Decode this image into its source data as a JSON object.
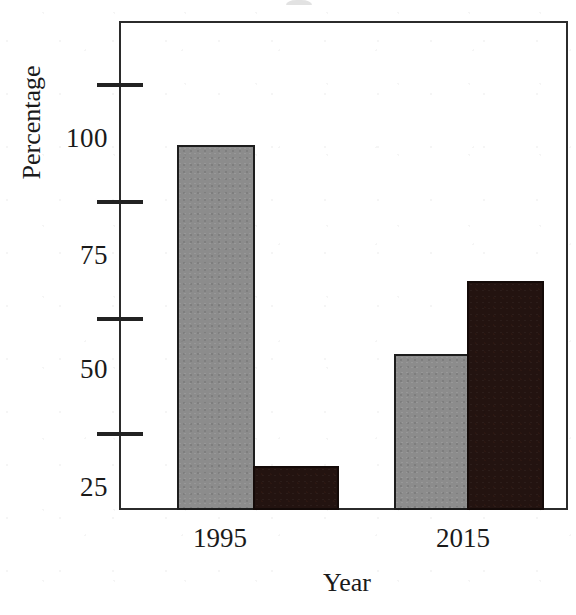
{
  "chart_data": {
    "type": "bar",
    "title": "",
    "xlabel": "Year",
    "ylabel": "Percentage",
    "categories": [
      "1995",
      "2015"
    ],
    "series": [
      {
        "name": "series-gray",
        "color": "#8c8c8c",
        "values": [
          95,
          52
        ]
      },
      {
        "name": "series-dark",
        "color": "#231310",
        "values": [
          29,
          67
        ]
      }
    ],
    "ylim": [
      20,
      120
    ],
    "ytick_labels": [
      "100",
      "75",
      "50",
      "25"
    ],
    "ytick_values": [
      100,
      75,
      50,
      25
    ],
    "grid": false,
    "legend": "none",
    "frame": "box"
  },
  "axes": {
    "y_title": "Percentage",
    "x_title": "Year",
    "y_ticks": [
      {
        "label": "100",
        "value": 100
      },
      {
        "label": "75",
        "value": 75
      },
      {
        "label": "50",
        "value": 50
      },
      {
        "label": "25",
        "value": 25
      }
    ],
    "x_groups": [
      {
        "label": "1995"
      },
      {
        "label": "2015"
      }
    ]
  },
  "bars": [
    {
      "group": "1995",
      "series": "series-gray",
      "value": 95
    },
    {
      "group": "1995",
      "series": "series-dark",
      "value": 29
    },
    {
      "group": "2015",
      "series": "series-gray",
      "value": 52
    },
    {
      "group": "2015",
      "series": "series-dark",
      "value": 67
    }
  ],
  "colors": {
    "gray_series": "#8c8c8c",
    "dark_series": "#231310",
    "axis": "#2b2b2b",
    "background": "#ffffff",
    "text": "#1a1a1a"
  }
}
